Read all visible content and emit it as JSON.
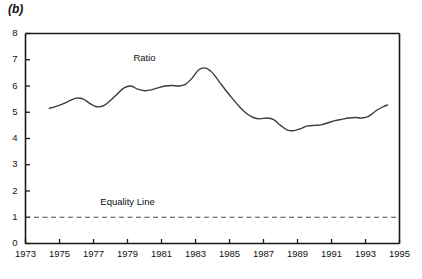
{
  "figure": {
    "panel_label": "(b)",
    "background_color": "#ffffff",
    "line_color": "#3a3a3a",
    "axis_color": "#1a1a1a"
  },
  "chart_data": {
    "type": "line",
    "title": "",
    "subtitle": "",
    "xlabel": "",
    "ylabel": "",
    "xlim": [
      1973,
      1995
    ],
    "ylim": [
      0,
      8
    ],
    "grid": false,
    "legend_position": "inline-annotation",
    "x_ticks": [
      1973,
      1975,
      1977,
      1979,
      1981,
      1983,
      1985,
      1987,
      1989,
      1991,
      1993,
      1995
    ],
    "x_tick_labels": [
      "1973",
      "1975",
      "1977",
      "1979",
      "1981",
      "1983",
      "1985",
      "1987",
      "1989",
      "1991",
      "1993",
      "1995"
    ],
    "y_ticks": [
      0,
      1,
      2,
      3,
      4,
      5,
      6,
      7,
      8
    ],
    "y_tick_labels": [
      "0",
      "1",
      "2",
      "3",
      "4",
      "5",
      "6",
      "7",
      "8"
    ],
    "annotations": [
      {
        "text": "Ratio",
        "x": 1980.0,
        "y": 7.05
      },
      {
        "text": "Equality Line",
        "x": 1979.0,
        "y": 1.55
      }
    ],
    "series": [
      {
        "name": "Ratio",
        "style": "solid",
        "color": "#3a3a3a",
        "x": [
          1974.4,
          1974.8,
          1975.2,
          1975.6,
          1976.0,
          1976.4,
          1976.8,
          1977.2,
          1977.6,
          1978.0,
          1978.4,
          1978.8,
          1979.2,
          1979.6,
          1980.0,
          1980.4,
          1980.8,
          1981.2,
          1981.6,
          1982.0,
          1982.4,
          1982.8,
          1983.2,
          1983.6,
          1984.0,
          1984.4,
          1984.8,
          1985.2,
          1985.6,
          1986.0,
          1986.4,
          1986.8,
          1987.2,
          1987.6,
          1988.0,
          1988.4,
          1988.8,
          1989.2,
          1989.6,
          1990.0,
          1990.4,
          1990.8,
          1991.2,
          1991.6,
          1992.0,
          1992.4,
          1992.8,
          1993.2,
          1993.6,
          1994.0,
          1994.3
        ],
        "y": [
          5.15,
          5.22,
          5.32,
          5.44,
          5.54,
          5.5,
          5.33,
          5.21,
          5.25,
          5.45,
          5.7,
          5.93,
          6.0,
          5.88,
          5.82,
          5.85,
          5.93,
          6.0,
          6.02,
          6.0,
          6.06,
          6.3,
          6.62,
          6.68,
          6.5,
          6.16,
          5.82,
          5.5,
          5.2,
          4.95,
          4.8,
          4.75,
          4.78,
          4.72,
          4.5,
          4.32,
          4.3,
          4.38,
          4.48,
          4.5,
          4.52,
          4.6,
          4.68,
          4.73,
          4.78,
          4.8,
          4.78,
          4.85,
          5.05,
          5.2,
          5.28
        ],
        "tail_x": [
          1994.3,
          1994.55,
          1994.8,
          1995.0
        ],
        "tail_y": [
          5.28,
          5.42,
          5.44,
          5.4
        ]
      },
      {
        "name": "Equality Line",
        "style": "dashed",
        "color": "#4a4a4a",
        "constant_y": 1
      }
    ]
  }
}
